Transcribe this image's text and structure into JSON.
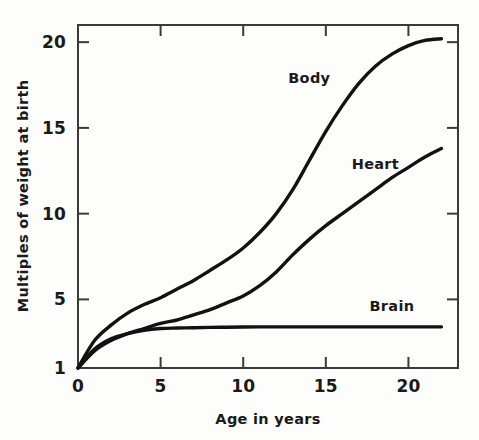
{
  "chart_data": {
    "type": "line",
    "title": "",
    "subtitle": "",
    "xlabel": "Age in years",
    "ylabel": "Multiples of weight at birth",
    "xlim": [
      0,
      23
    ],
    "ylim": [
      1,
      21
    ],
    "xticks": [
      0,
      5,
      10,
      15,
      20
    ],
    "xtick_labels": [
      "0",
      "5",
      "10",
      "15",
      "20"
    ],
    "yticks": [
      1,
      5,
      10,
      15,
      20
    ],
    "ytick_labels": [
      "1",
      "5",
      "10",
      "15",
      "20"
    ],
    "grid": false,
    "legend_position": "inline-annotations",
    "annotations": [
      {
        "text": "Body",
        "x": 14.0,
        "y": 17.6
      },
      {
        "text": "Heart",
        "x": 18.0,
        "y": 12.6
      },
      {
        "text": "Brain",
        "x": 19.0,
        "y": 4.3
      }
    ],
    "series": [
      {
        "name": "Body",
        "color": "#121212",
        "x": [
          0,
          1,
          2,
          3,
          4,
          5,
          6,
          7,
          8,
          9,
          10,
          11,
          12,
          13,
          14,
          15,
          16,
          17,
          18,
          19,
          20,
          21,
          22
        ],
        "values": [
          1.0,
          2.6,
          3.5,
          4.2,
          4.7,
          5.1,
          5.6,
          6.1,
          6.7,
          7.3,
          8.0,
          8.9,
          10.0,
          11.4,
          13.1,
          14.8,
          16.3,
          17.6,
          18.6,
          19.3,
          19.8,
          20.1,
          20.2
        ]
      },
      {
        "name": "Heart",
        "color": "#121212",
        "x": [
          0,
          1,
          2,
          3,
          4,
          5,
          6,
          7,
          8,
          9,
          10,
          11,
          12,
          13,
          14,
          15,
          16,
          17,
          18,
          19,
          20,
          21,
          22
        ],
        "values": [
          1.0,
          2.0,
          2.6,
          3.0,
          3.3,
          3.6,
          3.8,
          4.1,
          4.4,
          4.8,
          5.2,
          5.8,
          6.6,
          7.6,
          8.5,
          9.3,
          10.0,
          10.7,
          11.4,
          12.1,
          12.7,
          13.3,
          13.8
        ]
      },
      {
        "name": "Brain",
        "color": "#121212",
        "x": [
          0,
          1,
          2,
          3,
          4,
          5,
          6,
          7,
          8,
          9,
          10,
          11,
          12,
          13,
          14,
          15,
          16,
          17,
          18,
          19,
          20,
          21,
          22
        ],
        "values": [
          1.0,
          2.1,
          2.7,
          3.0,
          3.2,
          3.3,
          3.33,
          3.35,
          3.37,
          3.38,
          3.39,
          3.4,
          3.4,
          3.4,
          3.4,
          3.4,
          3.4,
          3.4,
          3.4,
          3.4,
          3.4,
          3.4,
          3.4
        ]
      }
    ]
  },
  "figure": {
    "background_color": "#fdfdfc",
    "axis_color": "#3a3a3a",
    "curve_color": "#121212"
  }
}
